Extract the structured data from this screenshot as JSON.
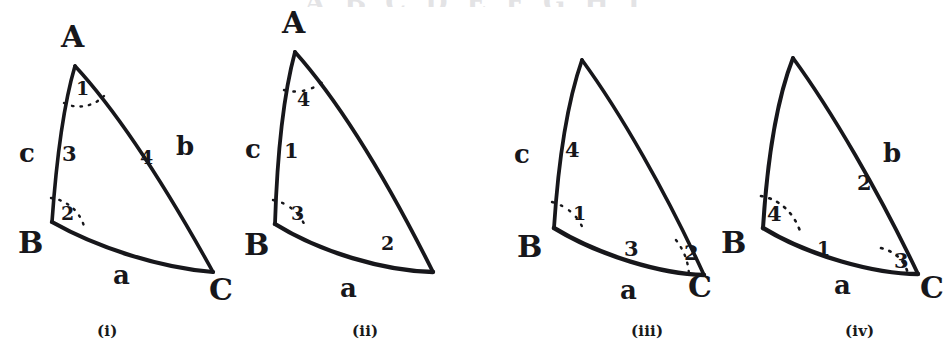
{
  "page": {
    "background_color": "#ffffff",
    "ink_color": "#17171b",
    "top_clipped_text": "A B C D E F G H I"
  },
  "figures": [
    {
      "caption": "(i)",
      "vertices": [
        {
          "label": "A",
          "position": "apex-top"
        },
        {
          "label": "B",
          "position": "lower-left"
        },
        {
          "label": "C",
          "position": "lower-right"
        }
      ],
      "sides": [
        {
          "label": "c",
          "position": "left"
        },
        {
          "label": "b",
          "position": "right"
        },
        {
          "label": "a",
          "position": "bottom"
        }
      ],
      "marks": [
        {
          "label": "1",
          "at": "angle-A",
          "arc": true
        },
        {
          "label": "2",
          "at": "angle-B",
          "arc": true
        },
        {
          "label": "3",
          "at": "side-c-inner",
          "arc": false
        },
        {
          "label": "4",
          "at": "side-b-inner",
          "arc": false
        }
      ]
    },
    {
      "caption": "(ii)",
      "vertices": [
        {
          "label": "A",
          "position": "apex-top"
        },
        {
          "label": "B",
          "position": "lower-left"
        }
      ],
      "sides": [
        {
          "label": "c",
          "position": "left"
        },
        {
          "label": "a",
          "position": "bottom"
        }
      ],
      "marks": [
        {
          "label": "4",
          "at": "angle-A",
          "arc": true
        },
        {
          "label": "1",
          "at": "side-c-inner",
          "arc": false
        },
        {
          "label": "3",
          "at": "angle-B",
          "arc": true
        },
        {
          "label": "2",
          "at": "side-a-inner",
          "arc": false
        }
      ]
    },
    {
      "caption": "(iii)",
      "vertices": [
        {
          "label": "B",
          "position": "lower-left"
        },
        {
          "label": "C",
          "position": "lower-right"
        }
      ],
      "sides": [
        {
          "label": "c",
          "position": "left"
        },
        {
          "label": "a",
          "position": "bottom"
        }
      ],
      "marks": [
        {
          "label": "4",
          "at": "side-c-inner",
          "arc": false
        },
        {
          "label": "1",
          "at": "angle-B",
          "arc": true
        },
        {
          "label": "3",
          "at": "side-a-inner",
          "arc": false
        },
        {
          "label": "2",
          "at": "angle-C",
          "arc": true
        }
      ]
    },
    {
      "caption": "(iv)",
      "vertices": [
        {
          "label": "B",
          "position": "lower-left"
        },
        {
          "label": "C",
          "position": "lower-right"
        }
      ],
      "sides": [
        {
          "label": "b",
          "position": "right"
        },
        {
          "label": "a",
          "position": "bottom"
        }
      ],
      "marks": [
        {
          "label": "2",
          "at": "side-b-inner",
          "arc": false
        },
        {
          "label": "4",
          "at": "angle-B",
          "arc": true
        },
        {
          "label": "1",
          "at": "side-a-inner",
          "arc": false
        },
        {
          "label": "3",
          "at": "angle-C",
          "arc": true
        }
      ]
    }
  ]
}
